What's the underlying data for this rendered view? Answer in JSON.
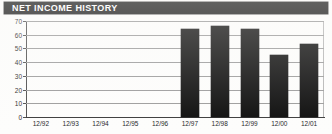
{
  "header": {
    "title": "NET INCOME HISTORY",
    "background_color": "#111111",
    "text_color": "#ffffff"
  },
  "chart_data": {
    "type": "bar",
    "title": "NET INCOME HISTORY",
    "xlabel": "",
    "ylabel": "",
    "categories": [
      "12/92",
      "12/93",
      "12/94",
      "12/95",
      "12/96",
      "12/97",
      "12/98",
      "12/99",
      "12/00",
      "12/01"
    ],
    "values": [
      null,
      null,
      null,
      null,
      null,
      64,
      66,
      64,
      45,
      53
    ],
    "ylim": [
      0,
      70
    ],
    "yticks": [
      0,
      10,
      20,
      30,
      40,
      50,
      60,
      70
    ],
    "ytick_labels": [
      "0",
      "10",
      "20",
      "30",
      "40",
      "50",
      "60",
      "70"
    ],
    "grid": true,
    "legend": false,
    "bar_color": "#0b0b0b",
    "gridline_color": "#9a9a9a",
    "axis_color": "#3a3a3a"
  }
}
